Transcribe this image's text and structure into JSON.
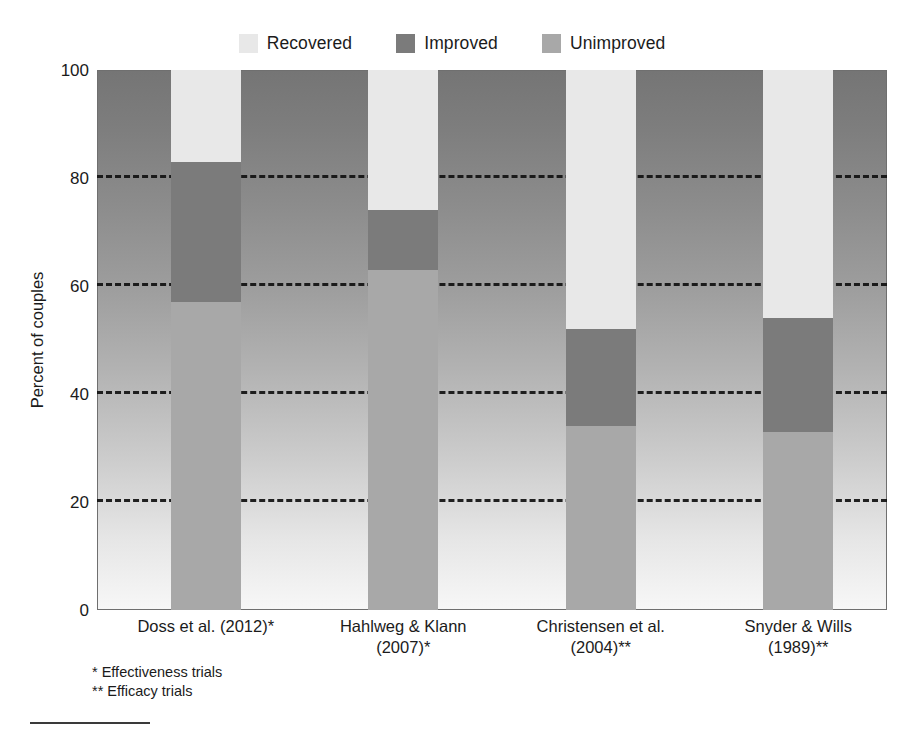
{
  "chart_data": {
    "type": "bar",
    "stacked": true,
    "title": "",
    "subtitle": "",
    "xlabel": "",
    "ylabel": "Percent of couples",
    "ylim": [
      0,
      100
    ],
    "yticks": [
      0,
      20,
      40,
      60,
      80,
      100
    ],
    "ytick_labels": [
      "0",
      "20",
      "40",
      "60",
      "80",
      "100"
    ],
    "grid": true,
    "grid_style": "dashed",
    "legend_position": "top-center",
    "categories": [
      "Doss et al. (2012)*",
      "Hahlweg & Klann (2007)*",
      "Christensen et al. (2004)**",
      "Snyder & Wills (1989)**"
    ],
    "category_lines": [
      [
        "Doss et al. (2012)*"
      ],
      [
        "Hahlweg & Klann",
        "(2007)*"
      ],
      [
        "Christensen et al.",
        "(2004)**"
      ],
      [
        "Snyder & Wills",
        "(1989)**"
      ]
    ],
    "series": [
      {
        "name": "Recovered",
        "color": "#e8e8e8",
        "values": [
          17,
          26,
          48,
          46
        ]
      },
      {
        "name": "Improved",
        "color": "#7b7b7b",
        "values": [
          26,
          11,
          18,
          21
        ]
      },
      {
        "name": "Unimproved",
        "color": "#a8a8a8",
        "values": [
          57,
          63,
          34,
          33
        ]
      }
    ],
    "stack_order": [
      "Unimproved",
      "Improved",
      "Recovered"
    ],
    "annotations": [
      "* Effectiveness trials",
      "** Efficacy trials"
    ]
  },
  "legend": {
    "entries": [
      {
        "label": "Recovered",
        "color": "#e8e8e8"
      },
      {
        "label": "Improved",
        "color": "#7b7b7b"
      },
      {
        "label": "Unimproved",
        "color": "#a8a8a8"
      }
    ]
  },
  "axis": {
    "y_title": "Percent of couples"
  },
  "footnotes": {
    "line1": "* Effectiveness trials",
    "line2": "** Efficacy trials"
  }
}
